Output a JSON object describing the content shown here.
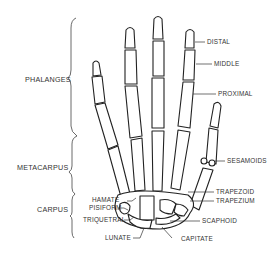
{
  "diagram": {
    "groups": [
      {
        "id": "phalanges",
        "label": "PHALANGES"
      },
      {
        "id": "metacarpus",
        "label": "METACARPUS"
      },
      {
        "id": "carpus",
        "label": "CARPUS"
      }
    ],
    "labels": {
      "distal": "DISTAL",
      "middle": "MIDDLE",
      "proximal": "PROXIMAL",
      "sesamoids": "SESAMOIDS",
      "trapezoid": "TRAPEZOID",
      "trapezium": "TRAPEZIUM",
      "scaphoid": "SCAPHOID",
      "capitate": "CAPITATE",
      "hamate": "HAMATE",
      "pisiform": "PISIFORM",
      "triquetral": "TRIQUETRAL",
      "lunate": "LUNATE"
    },
    "colors": {
      "ink": "#222222",
      "bone": "#ffffff",
      "text": "#333333"
    }
  }
}
